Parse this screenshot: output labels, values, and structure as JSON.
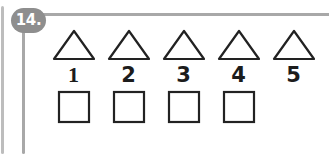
{
  "problem": {
    "number_label": "14.",
    "shape_row_label": "triangles",
    "answer_row_label": "answer-boxes"
  },
  "colors": {
    "badge_background": "#8e8e8e",
    "badge_text": "#ffffff",
    "frame_line": "#a8a8a8",
    "frame_line_outer": "#bdbdbd",
    "shape_stroke": "#222222",
    "numeral_text": "#1c1c1c",
    "page_background": "#ffffff"
  },
  "items": [
    {
      "shape": "triangle-icon",
      "numeral": "1",
      "answer_box": true,
      "answer_value": ""
    },
    {
      "shape": "triangle-icon",
      "numeral": "2",
      "answer_box": true,
      "answer_value": ""
    },
    {
      "shape": "triangle-icon",
      "numeral": "3",
      "answer_box": true,
      "answer_value": ""
    },
    {
      "shape": "triangle-icon",
      "numeral": "4",
      "answer_box": true,
      "answer_value": ""
    },
    {
      "shape": "triangle-icon",
      "numeral": "5",
      "answer_box": false,
      "answer_value": ""
    }
  ]
}
